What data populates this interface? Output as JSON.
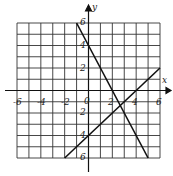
{
  "chart_data": {
    "type": "line",
    "title": "",
    "xlabel": "x",
    "ylabel": "y",
    "xlim": [
      -6,
      6
    ],
    "ylim": [
      -6,
      6
    ],
    "grid": true,
    "grid_step": 1,
    "x_tick_labels": [
      "-6",
      "-4",
      "-2",
      "0",
      "2",
      "4",
      "6"
    ],
    "y_tick_labels": [
      "6",
      "4",
      "2",
      "2",
      "4",
      "6"
    ],
    "series": [
      {
        "name": "y = -2x + 4",
        "points": [
          [
            -1,
            6
          ],
          [
            5,
            -6
          ]
        ]
      },
      {
        "name": "y = x - 4",
        "points": [
          [
            -2,
            -6
          ],
          [
            6,
            2
          ]
        ]
      }
    ],
    "intersection": [
      2.67,
      -1.33
    ]
  },
  "labels": {
    "x_axis": "x",
    "y_axis": "y",
    "origin": "0",
    "x_ticks": [
      {
        "text": "-6",
        "x": 13,
        "y": 98
      },
      {
        "text": "-4",
        "x": 37,
        "y": 98
      },
      {
        "text": "-2",
        "x": 61,
        "y": 98
      },
      {
        "text": "2",
        "x": 108,
        "y": 98
      },
      {
        "text": "4",
        "x": 132,
        "y": 98
      },
      {
        "text": "6",
        "x": 156,
        "y": 98
      }
    ],
    "y_ticks": [
      {
        "text": "6",
        "x": 80,
        "y": 18
      },
      {
        "text": "4",
        "x": 80,
        "y": 41
      },
      {
        "text": "2",
        "x": 80,
        "y": 64
      },
      {
        "text": "2",
        "x": 80,
        "y": 108
      },
      {
        "text": "4",
        "x": 80,
        "y": 131
      },
      {
        "text": "6",
        "x": 80,
        "y": 153
      }
    ]
  }
}
